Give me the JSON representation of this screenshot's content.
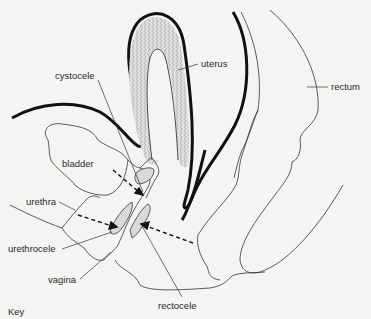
{
  "figure": {
    "key_label": "Key",
    "colors": {
      "background": "#f4f4f2",
      "line": "#1a1a1a",
      "uterus_fill": "#cfcfcf",
      "prolapse_fill": "#d9d9d9"
    }
  },
  "labels": {
    "uterus": "uterus",
    "rectum": "rectum",
    "cystocele": "cystocele",
    "bladder": "bladder",
    "urethra": "urethra",
    "urethrocele": "urethrocele",
    "vagina": "vagina",
    "rectocele": "rectocele"
  }
}
